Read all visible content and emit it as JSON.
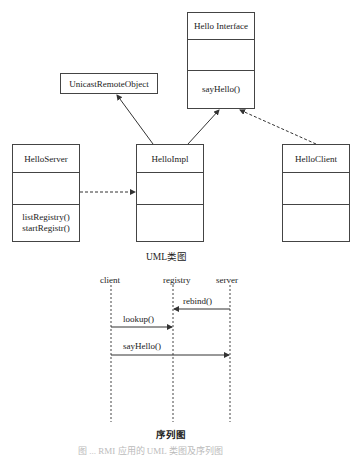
{
  "class_diagram": {
    "classes": [
      {
        "name": "Hello Interface",
        "attributes": "",
        "methods": [
          "sayHello()"
        ]
      },
      {
        "name": "UnicastRemoteObject"
      },
      {
        "name": "HelloServer",
        "attributes": "",
        "methods": [
          "listRegistry()",
          "startRegistr()"
        ]
      },
      {
        "name": "HelloImpl",
        "attributes": "",
        "methods": []
      },
      {
        "name": "HelloClient",
        "attributes": "",
        "methods": []
      }
    ],
    "relations": [
      {
        "from": "HelloImpl",
        "to": "UnicastRemoteObject",
        "type": "inheritance"
      },
      {
        "from": "HelloImpl",
        "to": "Hello Interface",
        "type": "realization"
      },
      {
        "from": "HelloClient",
        "to": "Hello Interface",
        "type": "dependency"
      },
      {
        "from": "HelloServer",
        "to": "HelloImpl",
        "type": "dependency"
      }
    ],
    "caption": "UML类图"
  },
  "sequence_diagram": {
    "lifelines": [
      "client",
      "registry",
      "server"
    ],
    "messages": [
      {
        "from": "server",
        "to": "registry",
        "label": "rebind()"
      },
      {
        "from": "client",
        "to": "registry",
        "label": "lookup()"
      },
      {
        "from": "client",
        "to": "server",
        "label": "sayHello()"
      }
    ],
    "caption": "序列图"
  },
  "figure_caption": "图 ... RMI 应用的 UML 类图及序列图"
}
